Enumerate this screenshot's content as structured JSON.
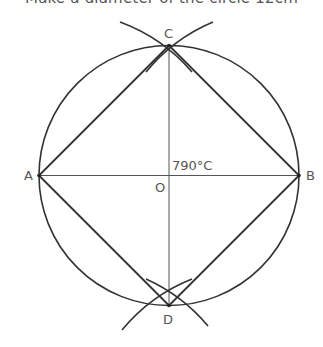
{
  "caption": "Make a diameter of the circle 12cm",
  "diagram": {
    "circle": {
      "cx": 169,
      "cy": 175.5,
      "r": 130
    },
    "points": {
      "A": {
        "x": 39,
        "y": 175.5,
        "label": "A"
      },
      "B": {
        "x": 299,
        "y": 175.5,
        "label": "B"
      },
      "C": {
        "x": 169,
        "y": 45.5,
        "label": "C"
      },
      "D": {
        "x": 169,
        "y": 305.5,
        "label": "D"
      },
      "O": {
        "x": 169,
        "y": 175.5,
        "label": "O"
      }
    },
    "annotation": "790°C",
    "stroke_color": "#333333",
    "label_color": "#555555"
  }
}
